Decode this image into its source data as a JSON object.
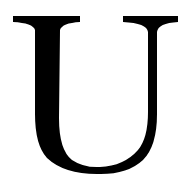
{
  "glyph": {
    "character": "U",
    "color": "#000000",
    "background": "#ffffff"
  }
}
